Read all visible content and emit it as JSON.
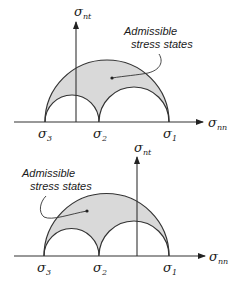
{
  "diagrams": [
    {
      "id": "top",
      "region_label_line1": "Admissible",
      "region_label_line2": "stress states",
      "axis_h": {
        "symbol": "σ",
        "sub": "nn"
      },
      "axis_v": {
        "symbol": "σ",
        "sub": "nt"
      },
      "principal": [
        {
          "symbol": "σ",
          "sub": "3"
        },
        {
          "symbol": "σ",
          "sub": "2"
        },
        {
          "symbol": "σ",
          "sub": "1"
        }
      ],
      "vertical_axis_between": "σ3 and σ2"
    },
    {
      "id": "bottom",
      "region_label_line1": "Admissible",
      "region_label_line2": "stress states",
      "axis_h": {
        "symbol": "σ",
        "sub": "nn"
      },
      "axis_v": {
        "symbol": "σ",
        "sub": "nt"
      },
      "principal": [
        {
          "symbol": "σ",
          "sub": "3"
        },
        {
          "symbol": "σ",
          "sub": "2"
        },
        {
          "symbol": "σ",
          "sub": "1"
        }
      ],
      "vertical_axis_between": "σ2 and σ1"
    }
  ],
  "colors": {
    "region_fill": "#d9d9d9",
    "stroke": "#333333"
  }
}
